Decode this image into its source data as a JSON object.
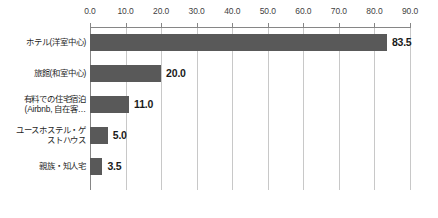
{
  "chart_data": {
    "type": "bar",
    "orientation": "horizontal",
    "title": "",
    "subtitle": "",
    "xlabel": "",
    "ylabel": "",
    "categories": [
      "ホテル(洋室中心)",
      "旅館(和室中心)",
      "有料での住宅宿泊\n(Airbnb, 自在客…",
      "ユースホステル・ゲ\nストハウス",
      "親族・知人宅"
    ],
    "values": [
      83.5,
      20.0,
      11.0,
      5.0,
      3.5
    ],
    "value_labels": [
      "83.5",
      "20.0",
      "11.0",
      "5.0",
      "3.5"
    ],
    "xlim": [
      0.0,
      90.0
    ],
    "xticks": [
      0.0,
      10.0,
      20.0,
      30.0,
      40.0,
      50.0,
      60.0,
      70.0,
      80.0,
      90.0
    ],
    "xtick_labels": [
      "0.0",
      "10.0",
      "20.0",
      "30.0",
      "40.0",
      "50.0",
      "60.0",
      "70.0",
      "80.0",
      "90.0"
    ],
    "grid": true,
    "grid_axis": "x",
    "legend": false,
    "legend_position": "none",
    "axis_position": "top",
    "colors": {
      "bar": "#595959",
      "gridline": "#c8c8c8",
      "axis": "#868686",
      "background": "#ffffff",
      "value_text": "#1a1a1a",
      "tick_text": "#3f3f3f",
      "category_text": "#1f1f1f"
    }
  }
}
